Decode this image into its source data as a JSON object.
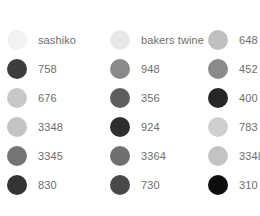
{
  "background_color": "#ffffff",
  "label_color": "#6e6e6e",
  "chart_data": {
    "type": "table",
    "xlabel": "",
    "ylabel": "",
    "legend_position": "grid",
    "grid": false,
    "columns": 3,
    "rows": 6,
    "swatch_shape": "circle",
    "swatch_diameter_px": 20,
    "categories": [
      "sashiko",
      "758",
      "676",
      "3348",
      "3345",
      "830",
      "bakers twine",
      "948",
      "356",
      "924",
      "3364",
      "730",
      "648",
      "452",
      "400",
      "783",
      "3348",
      "310"
    ],
    "values": [
      "#f2f2f2",
      "#3d3d3d",
      "#c8c8c8",
      "#c4c4c4",
      "#757575",
      "#333333",
      "#e8e8e8",
      "#8a8a8a",
      "#5e5e5e",
      "#2e2e2e",
      "#707070",
      "#494949",
      "#bfbfbf",
      "#8a8a8a",
      "#262626",
      "#cfcfcf",
      "#c4c4c4",
      "#0d0d0d"
    ]
  },
  "columns": [
    {
      "id": "column-1",
      "items": [
        {
          "label": "sashiko",
          "color": "#f2f2f2"
        },
        {
          "label": "758",
          "color": "#3d3d3d"
        },
        {
          "label": "676",
          "color": "#c8c8c8"
        },
        {
          "label": "3348",
          "color": "#c4c4c4"
        },
        {
          "label": "3345",
          "color": "#757575"
        },
        {
          "label": "830",
          "color": "#333333"
        }
      ]
    },
    {
      "id": "column-2",
      "items": [
        {
          "label": "bakers twine",
          "color": "#e8e8e8"
        },
        {
          "label": "948",
          "color": "#8a8a8a"
        },
        {
          "label": "356",
          "color": "#5e5e5e"
        },
        {
          "label": "924",
          "color": "#2e2e2e"
        },
        {
          "label": "3364",
          "color": "#707070"
        },
        {
          "label": "730",
          "color": "#494949"
        }
      ]
    },
    {
      "id": "column-3",
      "items": [
        {
          "label": "648",
          "color": "#bfbfbf"
        },
        {
          "label": "452",
          "color": "#8a8a8a"
        },
        {
          "label": "400",
          "color": "#262626"
        },
        {
          "label": "783",
          "color": "#cfcfcf"
        },
        {
          "label": "3348",
          "color": "#c4c4c4"
        },
        {
          "label": "310",
          "color": "#0d0d0d"
        }
      ]
    }
  ]
}
